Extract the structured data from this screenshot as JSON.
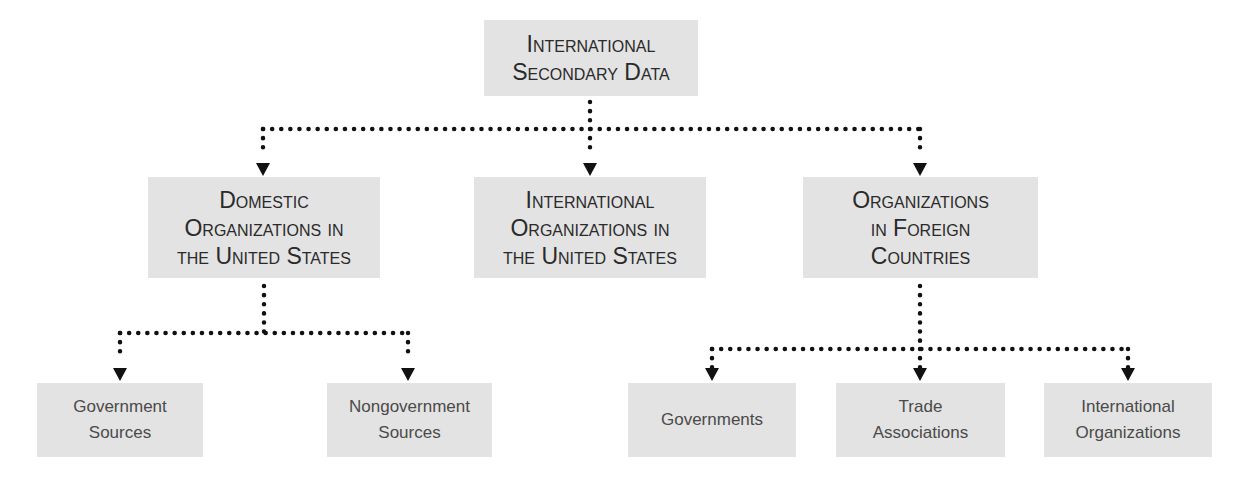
{
  "diagram": {
    "type": "hierarchy",
    "colors": {
      "box_fill": "#e3e3e3",
      "connector": "#111111",
      "heading_text": "#2a2a2a",
      "leaf_text": "#4a4a4a",
      "background": "#ffffff"
    },
    "root": {
      "lines": [
        "International",
        "Secondary Data"
      ]
    },
    "level1": [
      {
        "id": "domestic",
        "lines": [
          "Domestic",
          "Organizations in",
          "the United States"
        ]
      },
      {
        "id": "international-us",
        "lines": [
          "International",
          "Organizations in",
          "the United States"
        ]
      },
      {
        "id": "foreign",
        "lines": [
          "Organizations",
          "in Foreign",
          "Countries"
        ]
      }
    ],
    "level2_domestic": [
      {
        "id": "government-sources",
        "lines": [
          "Government",
          "Sources"
        ]
      },
      {
        "id": "nongovernment-sources",
        "lines": [
          "Nongovernment",
          "Sources"
        ]
      }
    ],
    "level2_foreign": [
      {
        "id": "governments",
        "lines": [
          "Governments"
        ]
      },
      {
        "id": "trade-associations",
        "lines": [
          "Trade",
          "Associations"
        ]
      },
      {
        "id": "international-organizations",
        "lines": [
          "International",
          "Organizations"
        ]
      }
    ],
    "edges": [
      [
        "root",
        "domestic"
      ],
      [
        "root",
        "international-us"
      ],
      [
        "root",
        "foreign"
      ],
      [
        "domestic",
        "government-sources"
      ],
      [
        "domestic",
        "nongovernment-sources"
      ],
      [
        "foreign",
        "governments"
      ],
      [
        "foreign",
        "trade-associations"
      ],
      [
        "foreign",
        "international-organizations"
      ]
    ],
    "connector_style": "dotted-with-arrowheads"
  }
}
